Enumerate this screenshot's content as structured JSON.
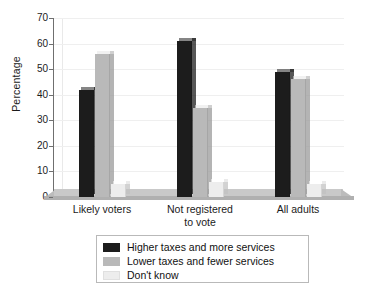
{
  "chart_data": {
    "type": "bar",
    "title": "",
    "subtitle": "",
    "xlabel": "",
    "ylabel": "Percentage",
    "ylim": [
      0,
      70
    ],
    "ytick_step": 10,
    "yticks": [
      0,
      10,
      20,
      30,
      40,
      50,
      60,
      70
    ],
    "grid": true,
    "grid_axis": "y",
    "legend_position": "bottom",
    "categories": [
      "Likely voters",
      "Not registered to vote",
      "All adults"
    ],
    "series": [
      {
        "name": "Higher taxes and more services",
        "color": "#1c1c1c",
        "values": [
          42,
          61,
          49
        ]
      },
      {
        "name": "Lower taxes and fewer services",
        "color": "#b9b9b9",
        "values": [
          56,
          35,
          46
        ]
      },
      {
        "name": "Don't know",
        "color": "#ededed",
        "values": [
          5,
          6,
          5
        ]
      }
    ]
  },
  "axes": {
    "y_label": "Percentage",
    "y_tick_labels": [
      "70",
      "60",
      "50",
      "40",
      "30",
      "20",
      "10",
      "0"
    ],
    "x_tick_labels": [
      "Likely voters",
      "Not registered\nto vote",
      "All adults"
    ],
    "x_tick_line1": [
      "Likely voters",
      "Not registered",
      "All adults"
    ],
    "x_tick_line2": [
      "",
      "to vote",
      ""
    ]
  },
  "legend": {
    "items": [
      {
        "label": "Higher taxes and more services",
        "color": "#1c1c1c"
      },
      {
        "label": "Lower taxes and fewer services",
        "color": "#b9b9b9"
      },
      {
        "label": "Don't know",
        "color": "#ededed"
      }
    ]
  }
}
